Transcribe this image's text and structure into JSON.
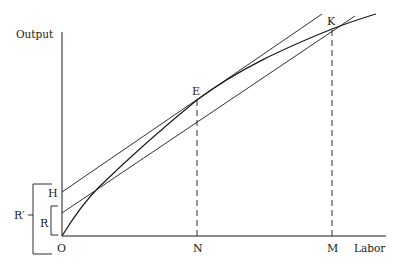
{
  "figure": {
    "type": "economics-production-diagram",
    "y_axis_label": "Output",
    "x_axis_label": "Labor",
    "origin_label": "O",
    "points": {
      "E": "E",
      "K": "K",
      "H": "H",
      "R": "R",
      "R_prime": "R′",
      "N": "N",
      "M": "M"
    },
    "elements": [
      "production curve from O through E and K",
      "tangent line at E with intercept H",
      "line from R through K",
      "dashed vertical from E to N",
      "dashed vertical from K to M",
      "bracket R spanning O to R",
      "bracket R′ spanning below O to H"
    ],
    "colors": {
      "ink": "#1a1a1a",
      "background": "#ffffff"
    }
  }
}
